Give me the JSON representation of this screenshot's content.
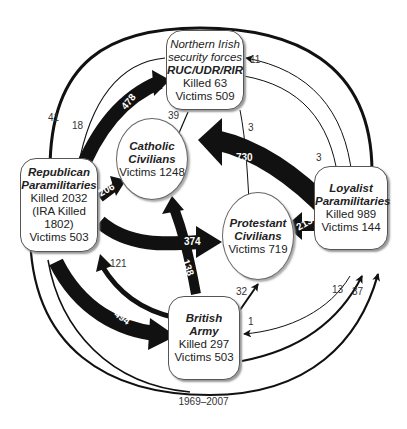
{
  "nodes": {
    "security_forces": {
      "line1": "Northern Irish",
      "line2": "security forces",
      "name": "RUC/UDR/RIR",
      "killed": "Killed 63",
      "victims": "Victims 509"
    },
    "catholic": {
      "name1": "Catholic",
      "name2": "Civilians",
      "victims": "Victims 1248"
    },
    "republican": {
      "name1": "Republican",
      "name2": "Paramilitaries",
      "killed": "Killed 2032",
      "ira": "(IRA Killed 1802)",
      "victims": "Victims 503"
    },
    "protestant": {
      "name1": "Protestant",
      "name2": "Civilians",
      "victims": "Victims 719"
    },
    "loyalist": {
      "name1": "Loyalist",
      "name2": "Paramilitaries",
      "killed": "Killed 989",
      "victims": "Victims 144"
    },
    "army": {
      "name1": "British",
      "name2": "Army",
      "killed": "Killed 297",
      "victims": "Victims 503"
    }
  },
  "edges": {
    "rep_to_sec": "478",
    "rep_to_cath": "206",
    "rep_to_prot": "374",
    "rep_to_army": "494",
    "loy_to_cath": "730",
    "loy_to_prot": "213",
    "army_to_cath": "138",
    "army_to_rep": "121",
    "army_to_prot": "32",
    "army_to_loy_outer": "37",
    "army_to_loy_inner": "13",
    "loy_to_army": "1",
    "sec_to_cath": "39",
    "sec_to_prot": "3",
    "sec_to_rep": "18",
    "loy_to_rep": "41",
    "sec_to_loy": "3",
    "loy_to_sec": "11"
  },
  "footer": "1969–2007"
}
